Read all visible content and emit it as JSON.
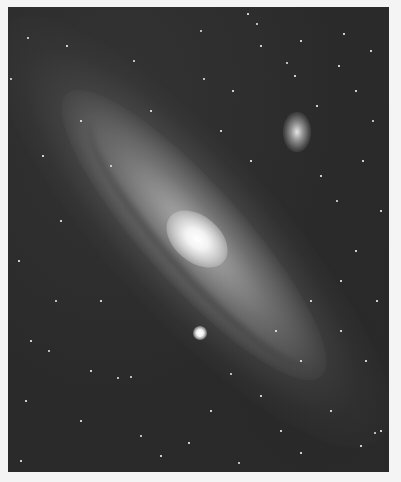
{
  "image": {
    "subject": "spiral galaxy with two companion galaxies on a star field",
    "background_color": "#2a2a2a",
    "border_color": "#f4f4f4",
    "frame": {
      "left": 8,
      "top": 7,
      "width": 381,
      "height": 465
    }
  },
  "galaxy": {
    "center": {
      "x": 192,
      "y": 232
    },
    "angle_deg": 48,
    "core_color": "#ffffff"
  },
  "companions": [
    {
      "name": "companion-upper-right",
      "x": 289,
      "y": 132,
      "w": 28,
      "h": 40
    },
    {
      "name": "companion-lower",
      "x": 192,
      "y": 326,
      "w": 14,
      "h": 14
    }
  ],
  "stars": [
    [
      27,
      37,
      2
    ],
    [
      66,
      45,
      1.5
    ],
    [
      200,
      30,
      2
    ],
    [
      247,
      13,
      1.5
    ],
    [
      256,
      23,
      2
    ],
    [
      300,
      40,
      1.5
    ],
    [
      343,
      33,
      1.5
    ],
    [
      133,
      60,
      2
    ],
    [
      203,
      78,
      2
    ],
    [
      260,
      45,
      1.5
    ],
    [
      286,
      62,
      2
    ],
    [
      338,
      65,
      1.5
    ],
    [
      370,
      50,
      1.5
    ],
    [
      10,
      78,
      2
    ],
    [
      232,
      90,
      1.5
    ],
    [
      294,
      75,
      1.5
    ],
    [
      355,
      90,
      1.5
    ],
    [
      316,
      105,
      1.5
    ],
    [
      372,
      120,
      2
    ],
    [
      42,
      155,
      1.5
    ],
    [
      110,
      165,
      2
    ],
    [
      362,
      160,
      1.5
    ],
    [
      336,
      200,
      2
    ],
    [
      380,
      210,
      1.5
    ],
    [
      355,
      250,
      1.5
    ],
    [
      18,
      260,
      1.5
    ],
    [
      55,
      300,
      2
    ],
    [
      30,
      340,
      1.5
    ],
    [
      48,
      350,
      2
    ],
    [
      90,
      370,
      1.5
    ],
    [
      117,
      377,
      2
    ],
    [
      130,
      376,
      2
    ],
    [
      230,
      373,
      2
    ],
    [
      260,
      395,
      1.5
    ],
    [
      80,
      420,
      1.5
    ],
    [
      140,
      435,
      2
    ],
    [
      188,
      442,
      1.5
    ],
    [
      238,
      462,
      2
    ],
    [
      300,
      452,
      1.5
    ],
    [
      374,
      432,
      2
    ],
    [
      380,
      430,
      1.5
    ],
    [
      360,
      445,
      1.5
    ],
    [
      330,
      410,
      1.5
    ],
    [
      20,
      460,
      1.5
    ],
    [
      160,
      455,
      1.5
    ],
    [
      100,
      300,
      1.5
    ],
    [
      220,
      130,
      1.5
    ],
    [
      250,
      160,
      1.5
    ],
    [
      150,
      110,
      1.5
    ],
    [
      80,
      120,
      1.5
    ],
    [
      310,
      300,
      1.5
    ],
    [
      340,
      330,
      1.5
    ],
    [
      365,
      360,
      1.5
    ],
    [
      300,
      360,
      1.5
    ],
    [
      280,
      430,
      1.5
    ],
    [
      60,
      220,
      1.5
    ],
    [
      25,
      400,
      1.5
    ],
    [
      210,
      410,
      1.5
    ],
    [
      275,
      330,
      1.5
    ],
    [
      340,
      280,
      1.5
    ],
    [
      376,
      300,
      1.5
    ],
    [
      320,
      175,
      1.5
    ]
  ]
}
